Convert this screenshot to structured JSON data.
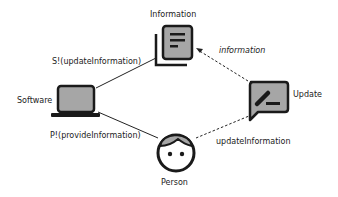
{
  "nodes": {
    "information": {
      "label": "Information",
      "icon": "document-stack-icon"
    },
    "software": {
      "label": "Software",
      "icon": "laptop-icon"
    },
    "update": {
      "label": "Update",
      "icon": "edit-comment-icon"
    },
    "person": {
      "label": "Person",
      "icon": "person-face-icon"
    }
  },
  "edges": {
    "software_information": {
      "label": "S!(updateInformation)",
      "style": "solid"
    },
    "software_person": {
      "label": "P!(provideInformation)",
      "style": "solid"
    },
    "update_information": {
      "label": "information",
      "style": "dashed-arrow"
    },
    "person_update": {
      "label": "updateInformation",
      "style": "dashed"
    }
  },
  "colors": {
    "icon_stroke": "#1a1a1a",
    "icon_fill": "#a6a6a6",
    "line": "#222222",
    "background": "#ffffff"
  }
}
